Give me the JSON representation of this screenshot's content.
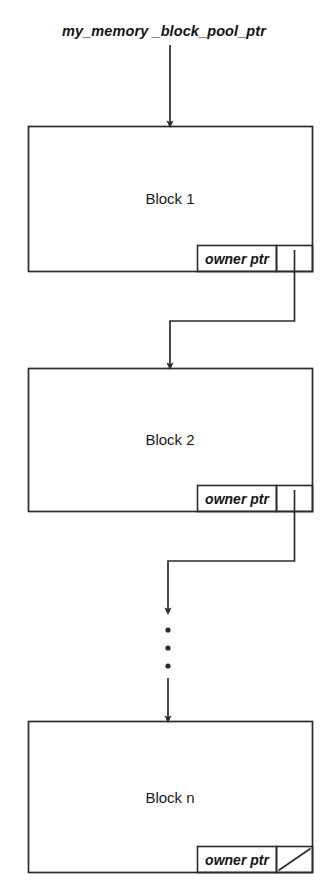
{
  "diagram": {
    "title_label": "my_memory _block_pool_ptr",
    "stroke_color": "#2b2b2b",
    "background_color": "#ffffff",
    "blocks": [
      {
        "name": "block-1",
        "title": "Block 1",
        "owner_label": "owner ptr",
        "pointer_state": "linked",
        "x": 28,
        "y": 126,
        "w": 285,
        "h": 146,
        "owner_x": 197,
        "owner_y": 245,
        "owner_w": 80,
        "owner_h": 27,
        "ptr_x": 277,
        "ptr_y": 245,
        "ptr_w": 36,
        "ptr_h": 27
      },
      {
        "name": "block-2",
        "title": "Block 2",
        "owner_label": "owner ptr",
        "pointer_state": "linked",
        "x": 28,
        "y": 368,
        "w": 285,
        "h": 144,
        "owner_x": 197,
        "owner_y": 485,
        "owner_w": 80,
        "owner_h": 27,
        "ptr_x": 277,
        "ptr_y": 485,
        "ptr_w": 36,
        "ptr_h": 27
      },
      {
        "name": "block-n",
        "title": "Block n",
        "owner_label": "owner ptr",
        "pointer_state": "null",
        "x": 28,
        "y": 721,
        "w": 285,
        "h": 152,
        "owner_x": 197,
        "owner_y": 846,
        "owner_w": 80,
        "owner_h": 27,
        "ptr_x": 277,
        "ptr_y": 846,
        "ptr_w": 36,
        "ptr_h": 27
      }
    ],
    "connectors": [
      {
        "name": "pool-ptr-to-block-1",
        "kind": "straight-down",
        "description": "arrow from my_memory _block_pool_ptr label down into top of Block 1"
      },
      {
        "name": "block-1-to-block-2",
        "kind": "elbow",
        "description": "line from Block 1 owner pointer cell down, left, then down into top of Block 2"
      },
      {
        "name": "block-2-to-ellipsis",
        "kind": "elbow",
        "description": "line from Block 2 owner pointer cell down, left, then down to vertical ellipsis"
      },
      {
        "name": "ellipsis-to-block-n",
        "kind": "straight-down",
        "description": "arrow continuing from vertical ellipsis down into top of Block n"
      }
    ],
    "ellipsis": {
      "name": "vertical-ellipsis",
      "dots": 3,
      "x": 168,
      "y_positions": [
        630,
        648,
        666
      ]
    }
  }
}
